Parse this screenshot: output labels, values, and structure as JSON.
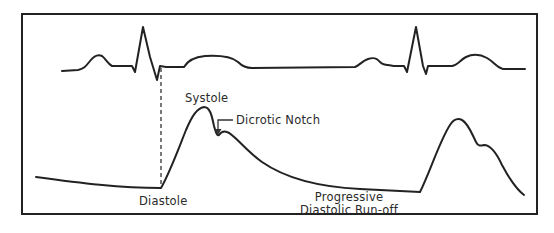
{
  "figure": {
    "colors": {
      "stroke": "#222222",
      "background": "#ffffff",
      "text": "#2a2a2a"
    }
  },
  "traces": {
    "ecg": {
      "name": "Electrocardiogram (ECG)",
      "beats_shown": 2
    },
    "arterial_pressure": {
      "name": "Arterial pressure waveform",
      "beats_shown": 2
    }
  },
  "labels": {
    "systole": "Systole",
    "dicrotic_notch": "Dicrotic Notch",
    "diastole": "Diastole",
    "runoff_line1": "Progressive",
    "runoff_line2": "Diastolic Run-off"
  },
  "annotations": {
    "dashed_line": "Alignment of ECG S-wave with onset of arterial upstroke",
    "arrow": "Pointer to dicrotic notch"
  }
}
